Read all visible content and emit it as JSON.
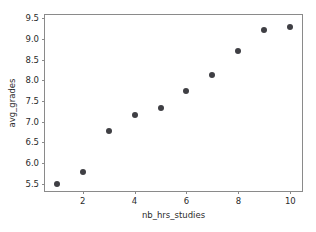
{
  "chart_data": {
    "type": "scatter",
    "title": "",
    "xlabel": "nb_hrs_studies",
    "ylabel": "avg_grades",
    "xlim": [
      0.55,
      10.45
    ],
    "ylim": [
      5.32,
      9.58
    ],
    "xticks": [
      2,
      4,
      6,
      8,
      10
    ],
    "yticks": [
      5.5,
      6.0,
      6.5,
      7.0,
      7.5,
      8.0,
      8.5,
      9.0,
      9.5
    ],
    "xticklabels": [
      "2",
      "4",
      "6",
      "8",
      "10"
    ],
    "yticklabels": [
      "5.5",
      "6.0",
      "6.5",
      "7.0",
      "7.5",
      "8.0",
      "8.5",
      "9.0",
      "9.5"
    ],
    "grid": false,
    "legend": null,
    "marker_color": "#3f3f44",
    "marker_size": 6,
    "axes_edge_color": "#8a8a8a",
    "background": "#ffffff",
    "x": [
      1,
      2,
      3,
      4,
      5,
      6,
      7,
      8,
      9,
      10
    ],
    "y": [
      5.49,
      5.78,
      6.77,
      7.16,
      7.34,
      7.75,
      8.13,
      8.72,
      9.21,
      9.3
    ],
    "points": [
      {
        "x": 1,
        "y": 5.49
      },
      {
        "x": 2,
        "y": 5.78
      },
      {
        "x": 3,
        "y": 6.77
      },
      {
        "x": 4,
        "y": 7.16
      },
      {
        "x": 5,
        "y": 7.34
      },
      {
        "x": 6,
        "y": 7.75
      },
      {
        "x": 7,
        "y": 8.13
      },
      {
        "x": 8,
        "y": 8.72
      },
      {
        "x": 9,
        "y": 9.21
      },
      {
        "x": 10,
        "y": 9.3
      }
    ]
  }
}
